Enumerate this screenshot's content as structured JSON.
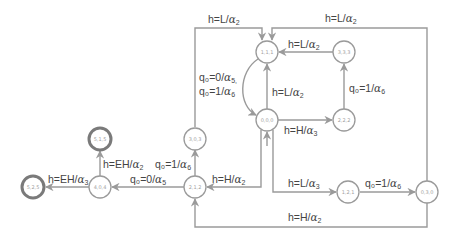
{
  "colors": {
    "edge": "#9a9a9a",
    "node_stroke": "#9a9a9a",
    "final_node_stroke": "#7a7a7a",
    "node_text": "#a0a0a0",
    "label_text": "#444444",
    "background": "#ffffff"
  },
  "nodes": [
    {
      "id": "n111",
      "label": "1,1,1",
      "final": false
    },
    {
      "id": "n333",
      "label": "3,3,3",
      "final": false
    },
    {
      "id": "n000",
      "label": "0,0,0",
      "final": false
    },
    {
      "id": "n222",
      "label": "2,2,2",
      "final": false
    },
    {
      "id": "n303",
      "label": "3,0,3",
      "final": false
    },
    {
      "id": "n212",
      "label": "2,1,2",
      "final": false
    },
    {
      "id": "n404",
      "label": "4,0,4",
      "final": false
    },
    {
      "id": "n515",
      "label": "5,1,5",
      "final": true
    },
    {
      "id": "n525",
      "label": "5,2,5",
      "final": true
    },
    {
      "id": "n121",
      "label": "1,2,1",
      "final": false
    },
    {
      "id": "n030",
      "label": "0,3,0",
      "final": false
    }
  ],
  "edges": [
    {
      "from": "3,0,3",
      "to": "1,1,1",
      "label": {
        "prefix": "h=L/",
        "greek": "α",
        "sub": "2"
      }
    },
    {
      "from": "0,3,0",
      "to": "1,1,1",
      "label": {
        "prefix": "h=L/",
        "greek": "α",
        "sub": "2"
      }
    },
    {
      "from": "3,3,3",
      "to": "1,1,1",
      "label": {
        "prefix": "h=L/",
        "greek": "α",
        "sub": "2"
      }
    },
    {
      "from": "0,0,0",
      "to": "1,1,1",
      "label": {
        "prefix": "h=L/",
        "greek": "α",
        "sub": "2"
      }
    },
    {
      "from": "2,2,2",
      "to": "3,3,3",
      "label": {
        "prefix": "q₀=1/",
        "greek": "α",
        "sub": "6"
      }
    },
    {
      "from": "0,0,0",
      "to": "2,2,2",
      "label": {
        "prefix": "h=H/",
        "greek": "α",
        "sub": "3"
      }
    },
    {
      "from": "1,1,1",
      "to": "0,0,0",
      "label_line1": {
        "prefix": "q₀=0/",
        "greek": "α",
        "sub": "5,"
      },
      "label_line2": {
        "prefix": "q₀=1/",
        "greek": "α",
        "sub": "6"
      }
    },
    {
      "from": "0,0,0",
      "to": "2,1,2",
      "label": {
        "prefix": "h=H/",
        "greek": "α",
        "sub": "2"
      }
    },
    {
      "from": "0,0,0",
      "to": "1,2,1",
      "label": {
        "prefix": "h=L/",
        "greek": "α",
        "sub": "3"
      }
    },
    {
      "from": "1,2,1",
      "to": "0,3,0",
      "label": {
        "prefix": "q₀=1/",
        "greek": "α",
        "sub": "6"
      }
    },
    {
      "from": "0,3,0",
      "to": "2,1,2",
      "label": {
        "prefix": "h=H/",
        "greek": "α",
        "sub": "2"
      }
    },
    {
      "from": "2,1,2",
      "to": "3,0,3",
      "label": {
        "prefix": "q₀=1/",
        "greek": "α",
        "sub": "6"
      }
    },
    {
      "from": "2,1,2",
      "to": "4,0,4",
      "label": {
        "prefix": "q₀=0/",
        "greek": "α",
        "sub": "5"
      }
    },
    {
      "from": "4,0,4",
      "to": "5,1,5",
      "label": {
        "prefix": "h=EH/",
        "greek": "α",
        "sub": "2"
      }
    },
    {
      "from": "4,0,4",
      "to": "5,2,5",
      "label": {
        "prefix": "h=EH/",
        "greek": "α",
        "sub": "3"
      }
    }
  ]
}
